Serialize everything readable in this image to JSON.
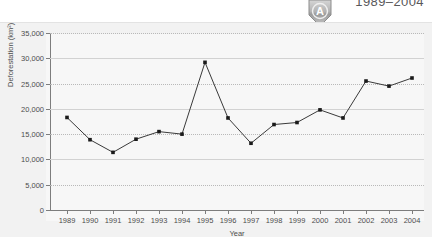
{
  "header": {
    "title": "1989–2004",
    "badge_letter": "A",
    "badge_icon": "shield-badge-icon"
  },
  "chart_data": {
    "type": "line",
    "title": "1989–2004",
    "xlabel": "Year",
    "ylabel": "Deforestation (km²)",
    "categories": [
      "1989",
      "1990",
      "1991",
      "1992",
      "1993",
      "1994",
      "1995",
      "1996",
      "1997",
      "1998",
      "1999",
      "2000",
      "2001",
      "2002",
      "2003",
      "2004"
    ],
    "values": [
      18300,
      13900,
      11400,
      14000,
      15500,
      15000,
      29200,
      18200,
      13200,
      16900,
      17300,
      19800,
      18200,
      25500,
      24500,
      26100
    ],
    "ylim": [
      0,
      35000
    ],
    "ytick_labels": [
      "0",
      "5,000",
      "10,000",
      "15,000",
      "20,000",
      "25,000",
      "30,000",
      "35,000"
    ],
    "ytick_values": [
      0,
      5000,
      10000,
      15000,
      20000,
      25000,
      30000,
      35000
    ],
    "grid": true,
    "legend": null,
    "marker": "square",
    "line_color": "#3a3a3a",
    "marker_color": "#1a1a1a",
    "plot_bg": "#f7f7f7",
    "panel_bg": "#f2f2f2",
    "grid_color": "#b9b9b9"
  }
}
